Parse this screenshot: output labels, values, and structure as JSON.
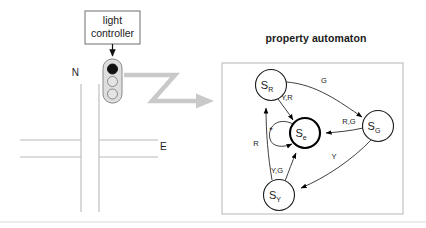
{
  "figure": {
    "title_right": "property automaton",
    "controller_box": {
      "line1": "light",
      "line2": "controller"
    },
    "compass": {
      "north": "N",
      "east": "E"
    },
    "traffic_light": {
      "lamps": [
        {
          "name": "red-lamp",
          "state": "on"
        },
        {
          "name": "yellow-lamp",
          "state": "off"
        },
        {
          "name": "green-lamp",
          "state": "off"
        }
      ]
    },
    "flow_arrow": {
      "name": "zigzag-arrow",
      "color": "#c9c9c9"
    }
  },
  "automaton": {
    "states": [
      {
        "id": "SR",
        "base": "S",
        "sub": "R",
        "cx": 271,
        "cy": 85,
        "r": 15.5,
        "accept": false
      },
      {
        "id": "SG",
        "base": "S",
        "sub": "G",
        "cx": 378,
        "cy": 126,
        "r": 15.5,
        "accept": false
      },
      {
        "id": "SY",
        "base": "S",
        "sub": "Y",
        "cx": 279,
        "cy": 195,
        "r": 15.5,
        "accept": false
      },
      {
        "id": "Se",
        "base": "S",
        "sub": "e",
        "cx": 305,
        "cy": 133,
        "r": 15.0,
        "accept": true
      }
    ],
    "transitions": [
      {
        "from": "SR",
        "to": "SG",
        "label": "G",
        "label_x": 324,
        "label_y": 83
      },
      {
        "from": "SR",
        "to": "Se",
        "label": "Y,R",
        "label_x": 283,
        "label_y": 99
      },
      {
        "from": "SG",
        "to": "Se",
        "label": "R,G",
        "label_x": 349,
        "label_y": 123
      },
      {
        "from": "SG",
        "to": "SY",
        "label": "Y",
        "label_x": 333,
        "label_y": 158
      },
      {
        "from": "SY",
        "to": "SR",
        "label": "R",
        "label_x": 256,
        "label_y": 145
      },
      {
        "from": "SY",
        "to": "Se",
        "label": "Y,G",
        "label_x": 275,
        "label_y": 172
      },
      {
        "from": "Se",
        "to": "Se",
        "label": "*",
        "label_x": 270,
        "label_y": 130,
        "self_loop": true
      }
    ]
  }
}
